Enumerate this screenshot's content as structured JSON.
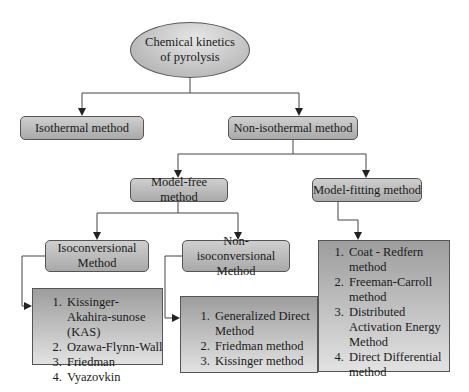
{
  "root": {
    "label": "Chemical kinetics of pyrolysis"
  },
  "level1": [
    {
      "label": "Isothermal method"
    },
    {
      "label": "Non-isothermal method"
    }
  ],
  "level2": [
    {
      "label": "Model-free method"
    },
    {
      "label": "Model-fitting method"
    }
  ],
  "level3": [
    {
      "label": "Isoconversional Method"
    },
    {
      "label": "Non-isoconversional Method"
    }
  ],
  "lists": {
    "isoconversional": [
      "Kissinger-Akahira-sunose (KAS)",
      "Ozawa-Flynn-Wall",
      "Friedman",
      "Vyazovkin"
    ],
    "non_isoconversional": [
      "Generalized Direct Method",
      "Friedman method",
      "Kissinger method"
    ],
    "model_fitting": [
      "Coat - Redfern method",
      "Freeman-Carroll method",
      "Distributed Activation Energy Method",
      "Direct Differential method"
    ]
  },
  "colors": {
    "box_fill_top": "#cfcfcf",
    "box_fill_bottom": "#a9a9a9",
    "border": "#555555",
    "line": "#444444"
  }
}
